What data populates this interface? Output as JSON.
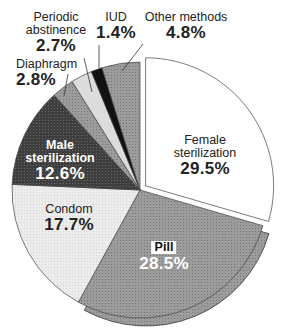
{
  "chart_data": {
    "type": "pie",
    "title": "",
    "start_angle_deg": 0,
    "direction": "clockwise",
    "exploded": [
      "Female sterilization"
    ],
    "slices": [
      {
        "label": "Female sterilization",
        "value": 29.5,
        "display": "29.5%",
        "color": "#ffffff",
        "label_line1": "Female",
        "label_line2": "sterilization"
      },
      {
        "label": "Pill",
        "value": 28.5,
        "display": "28.5%",
        "color": "#9a9a9a"
      },
      {
        "label": "Condom",
        "value": 17.7,
        "display": "17.7%",
        "color": "#e8e8e8"
      },
      {
        "label": "Male sterilization",
        "value": 12.6,
        "display": "12.6%",
        "color": "#4a4a4a",
        "label_line1": "Male",
        "label_line2": "sterilization"
      },
      {
        "label": "Diaphragm",
        "value": 2.8,
        "display": "2.8%",
        "color": "#a8a8a8"
      },
      {
        "label": "Periodic abstinence",
        "value": 2.7,
        "display": "2.7%",
        "color": "#dedede",
        "label_line1": "Periodic",
        "label_line2": "abstinence"
      },
      {
        "label": "IUD",
        "value": 1.4,
        "display": "1.4%",
        "color": "#111111"
      },
      {
        "label": "Other methods",
        "value": 4.8,
        "display": "4.8%",
        "color": "#a0a0a0"
      }
    ]
  },
  "labels": {
    "female": {
      "line1": "Female",
      "line2": "sterilization",
      "pct": "29.5%"
    },
    "pill": {
      "name": "Pill",
      "pct": "28.5%"
    },
    "condom": {
      "name": "Condom",
      "pct": "17.7%"
    },
    "male": {
      "line1": "Male",
      "line2": "sterilization",
      "pct": "12.6%"
    },
    "diaphragm": {
      "name": "Diaphragm",
      "pct": "2.8%"
    },
    "periodic": {
      "line1": "Periodic",
      "line2": "abstinence",
      "pct": "2.7%"
    },
    "iud": {
      "name": "IUD",
      "pct": "1.4%"
    },
    "other": {
      "name": "Other methods",
      "pct": "4.8%"
    }
  }
}
